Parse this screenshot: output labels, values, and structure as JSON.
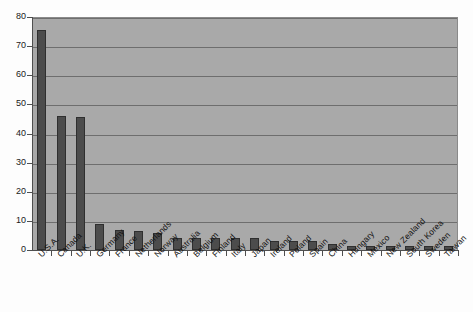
{
  "title_sliver": "",
  "chart_data": {
    "type": "bar",
    "title": "",
    "subtitle": "",
    "xlabel": "",
    "ylabel": "",
    "ylim": [
      0,
      80
    ],
    "ytick_step": 10,
    "yticks": [
      "0",
      "10",
      "20",
      "30",
      "40",
      "50",
      "60",
      "70",
      "80"
    ],
    "grid": true,
    "grid_axis": "y",
    "legend": false,
    "legend_position": "none",
    "bar_color": "#4c4c4c",
    "bar_edge_color": "#2f2f2f",
    "plot_background": "#a9a9a9",
    "gridline_color": "#6e6e6e",
    "axis_color": "#4f4f4f",
    "categories": [
      "U.S.A.",
      "Canada",
      "U.K.",
      "Germany",
      "France",
      "Netherlands",
      "Norway",
      "Australia",
      "Belgium",
      "Finland",
      "Italy",
      "Japan",
      "Ireland",
      "Poland",
      "Spain",
      "China",
      "Hungary",
      "Mexico",
      "New Zealand",
      "South Korea",
      "Sweden",
      "Taiwan"
    ],
    "values": [
      75.5,
      46.0,
      45.5,
      9.0,
      7.0,
      6.5,
      6.0,
      4.0,
      4.0,
      4.0,
      4.0,
      4.0,
      3.0,
      3.0,
      3.0,
      2.0,
      1.5,
      1.5,
      1.5,
      1.5,
      1.5,
      1.5
    ]
  }
}
